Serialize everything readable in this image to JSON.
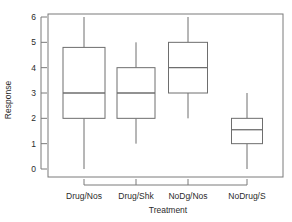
{
  "chart_data": {
    "type": "box",
    "title": "",
    "xlabel": "Treatment",
    "ylabel": "Response",
    "categories": [
      "Drug/Nos",
      "Drug/Shk",
      "NoDg/Nos",
      "NoDrug/S"
    ],
    "ytick_labels": [
      "0",
      "1",
      "2",
      "3",
      "4",
      "5",
      "6"
    ],
    "ytick_values": [
      0,
      1,
      2,
      3,
      4,
      5,
      6
    ],
    "ylim": [
      -0.28,
      6.28
    ],
    "grid": false,
    "legend": null,
    "box_color": "#6e6e6e",
    "frame_color": "#7a7a7a",
    "boxes": [
      {
        "category": "Drug/Nos",
        "whisker_low": 0.0,
        "q1": 2.0,
        "median": 3.0,
        "q3": 4.8,
        "whisker_high": 6.0,
        "outliers": []
      },
      {
        "category": "Drug/Shk",
        "whisker_low": 1.0,
        "q1": 2.0,
        "median": 3.0,
        "q3": 4.0,
        "whisker_high": 5.0,
        "outliers": []
      },
      {
        "category": "NoDg/Nos",
        "whisker_low": 2.0,
        "q1": 3.0,
        "median": 4.0,
        "q3": 5.0,
        "whisker_high": 6.0,
        "outliers": []
      },
      {
        "category": "NoDrug/S",
        "whisker_low": 0.0,
        "q1": 1.0,
        "median": 1.55,
        "q3": 2.0,
        "whisker_high": 3.0,
        "outliers": []
      }
    ]
  }
}
